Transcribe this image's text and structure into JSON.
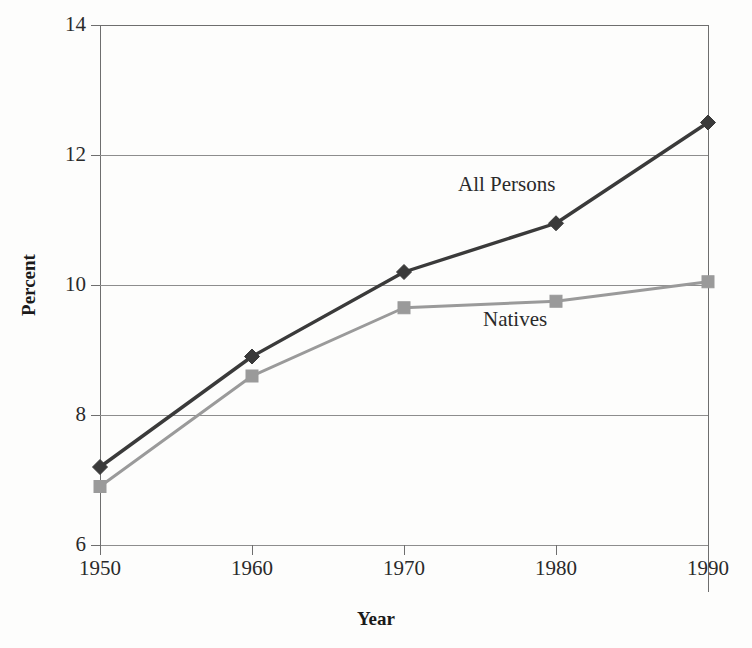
{
  "chart_data": {
    "type": "line",
    "title": "",
    "xlabel": "Year",
    "ylabel": "Percent",
    "x": [
      1950,
      1960,
      1970,
      1980,
      1990
    ],
    "xtick_labels": [
      "1950",
      "1960",
      "1970",
      "1980",
      "1990"
    ],
    "ytick_labels": [
      "14",
      "12",
      "10",
      "8",
      "6"
    ],
    "yticks": [
      14,
      12,
      10,
      8,
      6
    ],
    "xlim": [
      1950,
      1990
    ],
    "ylim": [
      6,
      14
    ],
    "grid": "horizontal",
    "legend_position": "inline-annotations",
    "series": [
      {
        "name": "All Persons",
        "values": [
          7.2,
          8.9,
          10.2,
          10.95,
          12.5
        ],
        "color": "#3a3a3a",
        "marker": "diamond",
        "annotation_label": "All Persons"
      },
      {
        "name": "Natives",
        "values": [
          6.9,
          8.6,
          9.65,
          9.75,
          10.05
        ],
        "color": "#9a9a9a",
        "marker": "square",
        "annotation_label": "Natives"
      }
    ],
    "annotations": [
      {
        "text": "All Persons",
        "x_px": 458,
        "y_px": 172
      },
      {
        "text": "Natives",
        "x_px": 483,
        "y_px": 307
      }
    ]
  },
  "axes": {
    "y_title": "Percent",
    "x_title": "Year"
  },
  "colors": {
    "all_persons": "#3a3a3a",
    "natives": "#9a9a9a",
    "axis": "#6e6e6e",
    "gridline": "#8d8d8d",
    "text": "#2a2a2a",
    "background": "#fdfdfc"
  }
}
